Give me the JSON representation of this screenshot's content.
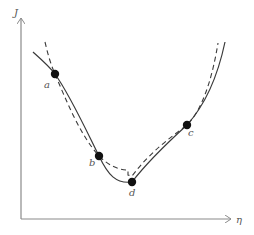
{
  "figure": {
    "type": "curve-fit-illustration",
    "axes": {
      "y_label": "J",
      "x_label": "η",
      "axis_color": "#8a8a8a"
    },
    "curves": {
      "solid": {
        "name": "true-curve",
        "color": "#3a3a3a",
        "style": "solid"
      },
      "dashed": {
        "name": "approximation-curve",
        "color": "#3a3a3a",
        "style": "dashed"
      }
    },
    "points": [
      {
        "id": "a",
        "label": "a",
        "x": 55,
        "y": 74,
        "lx": 47,
        "ly": 88
      },
      {
        "id": "b",
        "label": "b",
        "x": 99,
        "y": 156,
        "lx": 91,
        "ly": 167
      },
      {
        "id": "d",
        "label": "d",
        "x": 132,
        "y": 182,
        "lx": 129,
        "ly": 196
      },
      {
        "id": "c",
        "label": "c",
        "x": 187,
        "y": 125,
        "lx": 189,
        "ly": 136
      }
    ]
  }
}
